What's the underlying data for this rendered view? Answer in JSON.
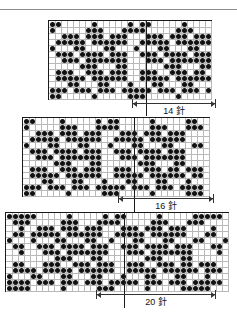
{
  "page": {
    "kind": "fair-isle-grid-charts",
    "divider_color": "#8c8c8c",
    "dot_color": "#111111",
    "grid_line_color": "#b9b9b9",
    "border_color": "#1a1a1a"
  },
  "charts": [
    {
      "id": "chart-1",
      "caption": "14 針",
      "caption_number": "14",
      "caption_unit": "針",
      "columns": 27,
      "rows": 13,
      "repeat_line_columns": [
        14
      ],
      "row_labels": [
        {
          "row": 13,
          "text": "13"
        },
        {
          "row": 10,
          "text": "10"
        },
        {
          "row": 1,
          "text": "1"
        }
      ],
      "grid": [
        "110000010000010110000010000011",
        "100000111000111100000111000111",
        "001110111011100011101110111000",
        "011111011111100111110111111000",
        "100011000110001000110001100011",
        "011101111011100111011110111000",
        "001110111111100011101111111000",
        "000001110001100000011100011000",
        "011100111011100111001110110111",
        "011111011111100111110111111011",
        "000110001100010001100011000100",
        "111011101110111110111011101111",
        "110000010000011100000100000111"
      ]
    },
    {
      "id": "chart-2",
      "caption": "16 針",
      "caption_number": "16",
      "caption_unit": "針",
      "columns": 31,
      "rows": 13,
      "repeat_line_columns": [
        16
      ],
      "row_labels": [
        {
          "row": 13,
          "text": "13"
        },
        {
          "row": 10,
          "text": "10"
        },
        {
          "row": 1,
          "text": "1"
        }
      ],
      "grid": [
        "1100001000001011000001000001100",
        "1000001110001111000001110001110",
        "0011101110111000111011101110000",
        "0111110111111001111101111110000",
        "1000110001100010001100011000110",
        "0111011110111001110111101110000",
        "0011101111111000111011111110000",
        "0000011100011000000111000110000",
        "0111001110111001110011101101110",
        "0111110111111001111101111110110",
        "0001100011000100011000110001000",
        "1110111011101111101110111011110",
        "1100000100000111000001000001110"
      ]
    },
    {
      "id": "chart-3",
      "caption": "20 針",
      "caption_number": "20",
      "caption_unit": "針",
      "columns": 37,
      "rows": 13,
      "repeat_line_columns": [
        17
      ],
      "row_labels": [
        {
          "row": 13,
          "text": "13"
        },
        {
          "row": 10,
          "text": "10"
        },
        {
          "row": 1,
          "text": "1"
        }
      ],
      "grid": [
        "1111100000100000101100000100000111110",
        "0111000001110001111000001110001110000",
        "0010011101110111000111011101110000100",
        "0110111110111111001111101111110001100",
        "1000100011000110010001100011000110001",
        "0110011101111011100111011110111000110",
        "0010001110111111100011101111111000010",
        "0000000011100011000000011100011000000",
        "0110001110011101110011100111011011100",
        "0111101111101111110011111011111101110",
        "1000110001100011000100011000110001000",
        "1111011101110111011111011101110111110",
        "1111000001000001110000010000011111000"
      ]
    }
  ]
}
